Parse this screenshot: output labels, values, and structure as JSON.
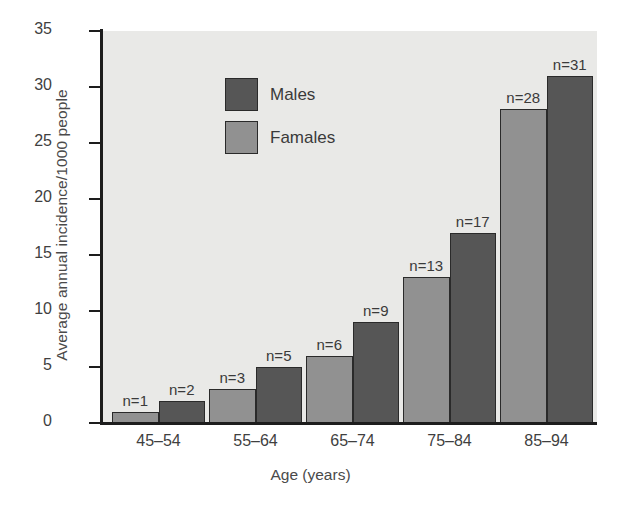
{
  "chart_data": {
    "type": "bar",
    "title": "",
    "xlabel": "Age (years)",
    "ylabel": "Average annual incidence/1000 people",
    "categories": [
      "45–54",
      "55–64",
      "65–74",
      "75–84",
      "85–94"
    ],
    "series": [
      {
        "name": "Famales",
        "color": "#919191",
        "values": [
          1,
          3,
          6,
          13,
          28
        ],
        "point_labels": [
          "n=1",
          "n=3",
          "n=6",
          "n=13",
          "n=28"
        ]
      },
      {
        "name": "Males",
        "color": "#565656",
        "values": [
          2,
          5,
          9,
          17,
          31
        ],
        "point_labels": [
          "n=2",
          "n=5",
          "n=9",
          "n=17",
          "n=31"
        ]
      }
    ],
    "ylim": [
      0,
      35
    ],
    "yticks": [
      0,
      5,
      10,
      15,
      20,
      25,
      30,
      35
    ],
    "ytick_labels": [
      "0",
      "5",
      "10",
      "15",
      "20",
      "25",
      "30",
      "35"
    ],
    "grid": false,
    "legend_position": "top-left",
    "plot_background": "#e9e9e7",
    "axis_color": "#1d1d1d"
  },
  "legend": {
    "entries": [
      {
        "label": "Males",
        "swatch": "males"
      },
      {
        "label": "Famales",
        "swatch": "females"
      }
    ]
  }
}
